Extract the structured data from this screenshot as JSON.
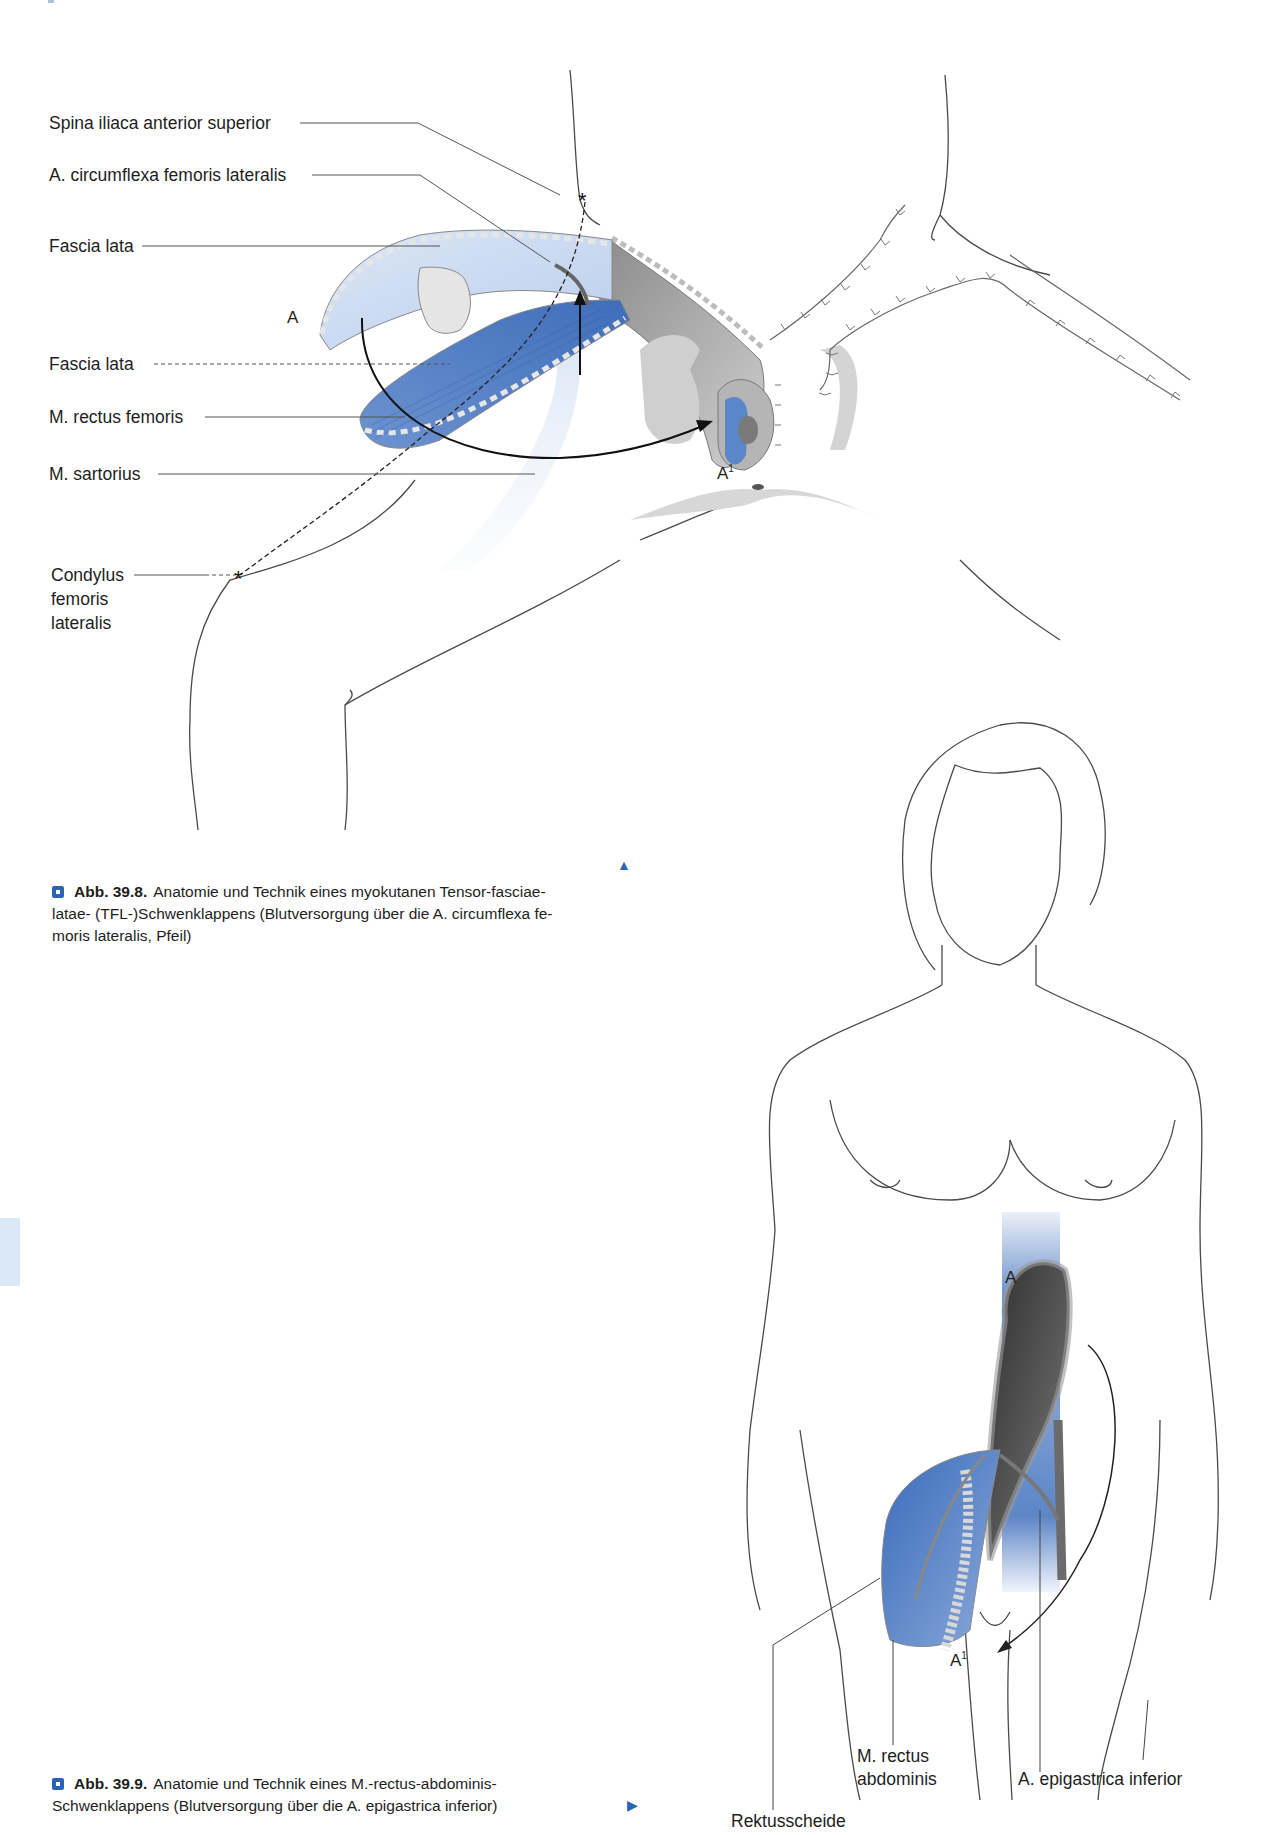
{
  "figure_1": {
    "labels": {
      "spina": "Spina iliaca anterior superior",
      "circumflexa": "A. circumflexa femoris lateralis",
      "fascia_lata_1": "Fascia lata",
      "fascia_lata_2": "Fascia lata",
      "rectus_femoris": "M. rectus femoris",
      "sartorius": "M. sartorius",
      "condylus_1": "Condylus",
      "condylus_2": "femoris",
      "condylus_3": "lateralis"
    },
    "markers": {
      "a": "A",
      "a1": "A",
      "a1_sup": "1"
    },
    "caption": {
      "number": "Abb. 39.8.",
      "line1": "Anatomie und Technik eines myokutanen Tensor-fasciae-",
      "line2": "latae- (TFL-)Schwenklappens (Blutversorgung über die A. circumflexa fe-",
      "line3": "moris lateralis, Pfeil)"
    },
    "nav_symbol": "▲"
  },
  "figure_2": {
    "labels": {
      "rectus_1": "M. rectus",
      "rectus_2": "abdominis",
      "epigastrica": "A. epigastrica inferior",
      "rektusscheide": "Rektusscheide"
    },
    "markers": {
      "a": "A",
      "a1": "A",
      "a1_sup": "1"
    },
    "caption": {
      "number": "Abb. 39.9.",
      "line1": "Anatomie und Technik eines M.-rectus-abdominis-",
      "line2": "Schwenklappens (Blutversorgung über die A. epigastrica inferior)"
    },
    "nav_symbol": "▶"
  },
  "colors": {
    "accent_blue": "#2a63b4",
    "muscle_blue": "#4d7cc4",
    "light_blue": "#c9daf0",
    "line": "#555555",
    "gray_tissue": "#9a9a9a"
  }
}
